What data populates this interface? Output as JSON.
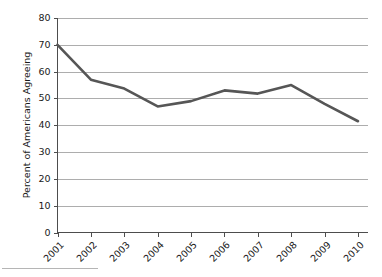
{
  "chart_data": {
    "type": "line",
    "title": "",
    "subtitle": "",
    "xlabel": "",
    "ylabel": "Percent of Americans Agreeing",
    "categories": [
      "2001",
      "2002",
      "2003",
      "2004",
      "2005",
      "2006",
      "2007",
      "2008",
      "2009",
      "2010"
    ],
    "values": [
      70,
      57,
      53.7,
      47,
      49,
      53,
      51.8,
      55,
      48,
      41.5
    ],
    "series": [
      {
        "name": "Percent of Americans Agreeing",
        "values": [
          70,
          57,
          53.7,
          47,
          49,
          53,
          51.8,
          55,
          48,
          41.5
        ]
      }
    ],
    "ylim": [
      0,
      80
    ],
    "ytick_values": [
      0,
      10,
      20,
      30,
      40,
      50,
      60,
      70,
      80
    ],
    "ytick_labels": [
      "0",
      "10",
      "20",
      "30",
      "40",
      "50",
      "60",
      "70",
      "80"
    ],
    "xtick_labels": [
      "2001",
      "2002",
      "2003",
      "2004",
      "2005",
      "2006",
      "2007",
      "2008",
      "2009",
      "2010"
    ],
    "xtick_rotation": -45,
    "grid": "horizontal",
    "legend": "none",
    "line_color": "#565656",
    "grid_color": "#adadad",
    "axis_color": "#4d4d4d",
    "background_color": "#ffffff",
    "annotations": []
  },
  "axes": {
    "y_title": "Percent of Americans Agreeing"
  }
}
